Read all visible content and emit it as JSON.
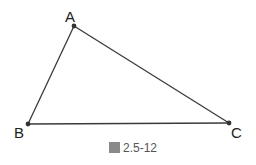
{
  "figure": {
    "caption_prefix_glyph": "圖",
    "caption_number": "2.5-12",
    "colors": {
      "line": "#3a3a3a",
      "text": "#222222",
      "caption": "#555555"
    }
  },
  "triangle": {
    "vertices": [
      {
        "label": "A",
        "x": 74,
        "y": 26
      },
      {
        "label": "B",
        "x": 28,
        "y": 124
      },
      {
        "label": "C",
        "x": 229,
        "y": 123
      }
    ],
    "edges": [
      "AB",
      "BC",
      "CA"
    ]
  }
}
